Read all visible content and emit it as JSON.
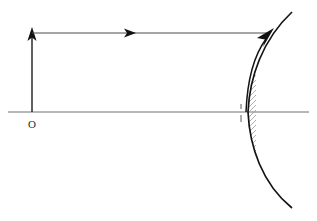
{
  "diagram": {
    "canvas": {
      "width": 317,
      "height": 221,
      "background": "#ffffff"
    },
    "labels": {
      "origin": "O"
    },
    "colors": {
      "axis": "#6f6f6f",
      "ray": "#4a4a4a",
      "object_arrow": "#1c1c1c",
      "mirror": "#141414",
      "hatching": "#9a9a9a",
      "label": "#2b2b2b",
      "background": "#ffffff"
    },
    "optical_axis": {
      "name": "principal-axis",
      "x_start": 8,
      "x_end": 309,
      "y": 112
    },
    "object_arrow": {
      "name": "object-arrow",
      "x": 32,
      "y_base": 112,
      "y_tip": 28,
      "direction": "up",
      "head_width": 9,
      "head_length": 14
    },
    "incident_ray": {
      "name": "incident-ray-parallel",
      "x_start": 32,
      "x_end": 268,
      "y": 33,
      "direction": "right",
      "midpoint_arrow_x": 129
    },
    "reflected_ray": {
      "name": "reflected-ray-to-mirror",
      "x_start": 248,
      "y_start": 112,
      "x_end": 272,
      "y_end": 31,
      "direction": "up-right"
    },
    "mirror": {
      "name": "concave-mirror",
      "vertex_x": 248,
      "vertex_y": 112,
      "top_x": 292,
      "top_y": 12,
      "bottom_x": 292,
      "bottom_y": 208,
      "hatch_side": "right",
      "hatch_count": 46,
      "hatch_length": 22,
      "hatch_angle_deg": 45
    },
    "focus_tick": {
      "name": "mirror-vertex-tick",
      "x": 241,
      "y_top": 104,
      "y_bottom": 122
    },
    "origin_label": {
      "name": "origin-label",
      "x": 32,
      "y": 127
    }
  }
}
